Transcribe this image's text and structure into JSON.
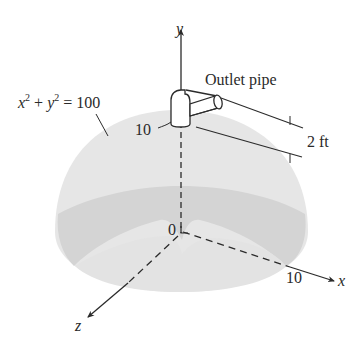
{
  "figure": {
    "type": "hemispherical tank with outlet pipe",
    "axes": {
      "y_label": "y",
      "x_label": "x",
      "z_label": "z",
      "origin_label": "0"
    },
    "labels": {
      "equation_x": "x",
      "equation_plus": "+",
      "equation_y": "y",
      "equation_exp": "2",
      "equation_rhs": "= 100",
      "outlet_pipe": "Outlet pipe",
      "pipe_height": "2 ft",
      "radius_top": "10",
      "radius_x": "10"
    },
    "colors": {
      "dome_light": "#e4e4e4",
      "dome_dark": "#d2d2d2",
      "line": "#2b2b2b"
    }
  }
}
